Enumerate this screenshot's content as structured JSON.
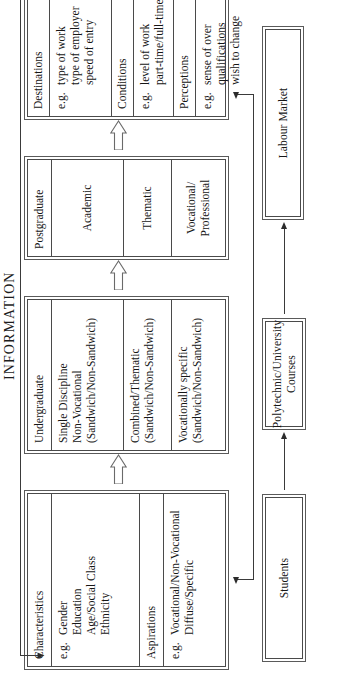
{
  "diagram": {
    "orientation": "rotated-90-ccw",
    "feedback_label": "INFORMATION",
    "stages": [
      {
        "name": "students",
        "label": "Students"
      },
      {
        "name": "courses",
        "label": "Polytechnic/University\nCourses"
      },
      {
        "name": "labour",
        "label": "Labour Market"
      }
    ],
    "student_box": {
      "name": "student-attributes",
      "rows": [
        {
          "kind": "head",
          "label": "Characteristics"
        },
        {
          "kind": "body",
          "eg": "e.g.",
          "items": "Gender\nEducation\nAge/Social Class\nEthnicity"
        },
        {
          "kind": "head",
          "label": "Aspirations"
        },
        {
          "kind": "body",
          "eg": "e.g.",
          "items": "Vocational/Non-Vocational\nDiffuse/Specific"
        }
      ]
    },
    "undergraduate_box": {
      "name": "undergraduate-courses",
      "rows": [
        {
          "kind": "head",
          "label": "Undergraduate"
        },
        {
          "kind": "body",
          "items": "Single Discipline\nNon-Vocational\n(Sandwich/Non-Sandwich)"
        },
        {
          "kind": "body",
          "items": "Combined/Thematic\n(Sandwich/Non-Sandwich)"
        },
        {
          "kind": "body",
          "items": "Vocationally specific\n(Sandwich/Non-Sandwich)"
        }
      ]
    },
    "postgraduate_box": {
      "name": "postgraduate-courses",
      "rows": [
        {
          "kind": "head",
          "label": "Postgraduate"
        },
        {
          "kind": "center",
          "items": "Academic"
        },
        {
          "kind": "center",
          "items": "Thematic"
        },
        {
          "kind": "center",
          "items": "Vocational/\nProfessional"
        }
      ]
    },
    "outcomes_box": {
      "name": "labour-market-outcomes",
      "rows": [
        {
          "kind": "head",
          "label": "Destinations"
        },
        {
          "kind": "body",
          "eg": "e.g.",
          "items": "type of work\ntype of employer\nspeed of entry"
        },
        {
          "kind": "head",
          "label": "Conditions"
        },
        {
          "kind": "body",
          "eg": "e.g.",
          "items": "level of work\npart-time/full-time pay"
        },
        {
          "kind": "head",
          "label": "Perceptions"
        },
        {
          "kind": "body",
          "eg": "e.g.",
          "items": "sense of over\nqualifications\nwish to change"
        }
      ]
    },
    "colors": {
      "line": "#3a3a3a",
      "box_border": "#4a4a4a",
      "text": "#161616",
      "background": "#ffffff"
    }
  }
}
